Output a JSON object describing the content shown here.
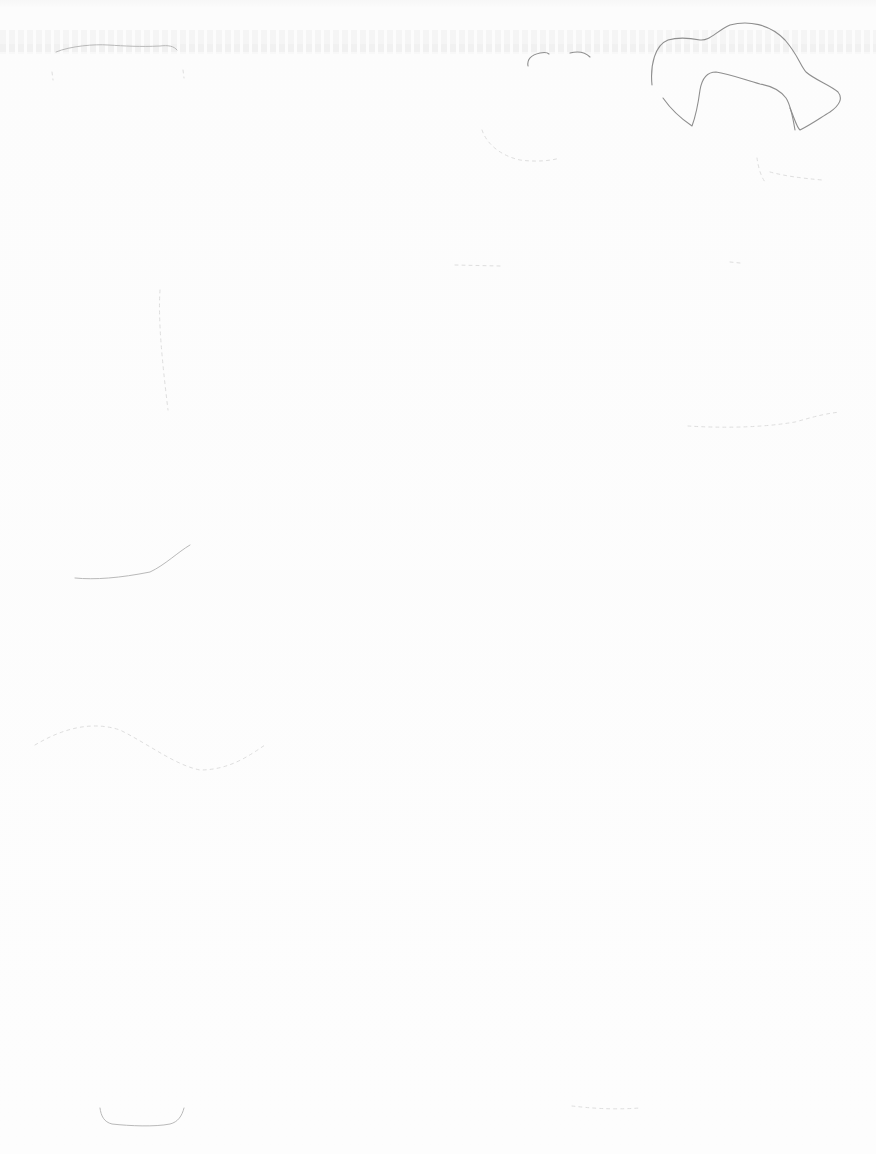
{
  "page": {
    "kind": "scanned blank page with faint pencil sketch marks",
    "background_color": "#fbfbfb",
    "sketch_stroke_color": "#8e8e8e",
    "visible_text": "",
    "bleed_through_text": "illegible"
  },
  "sketches": [
    {
      "name": "hat-outline",
      "region": "top-right"
    },
    {
      "name": "brow-arcs",
      "region": "top-center"
    },
    {
      "name": "top-left-wavy-line",
      "region": "top-left"
    },
    {
      "name": "left-curve",
      "region": "middle-left"
    },
    {
      "name": "bottom-left-curve",
      "region": "bottom-left"
    },
    {
      "name": "faint-right-stroke",
      "region": "middle-right"
    }
  ]
}
